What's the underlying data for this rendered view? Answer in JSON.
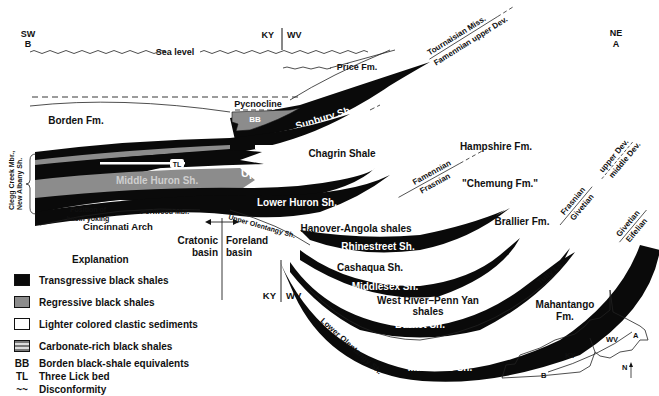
{
  "orientation": {
    "left_dir": "SW",
    "left_point": "B",
    "right_dir": "NE",
    "right_point": "A"
  },
  "state_border_labels": {
    "left": "KY",
    "right": "WV"
  },
  "sea_level": "Sea level",
  "pycnocline": "Pycnocline",
  "units": {
    "price": "Price Fm.",
    "borden": "Borden Fm.",
    "bb": "BB",
    "sunbury": "Sunbury Sh.",
    "berea": "Berea-Bedford",
    "cleveland": "Cleveland Sh.",
    "tl": "TL",
    "upper_huron": "Upper Huron Sh.",
    "middle_huron": "Middle Huron Sh.",
    "chagrin": "Chagrin Shale",
    "hampshire": "Hampshire Fm.",
    "chemung": "\"Chemung Fm.\"",
    "brallier": "Brallier Fm.",
    "lower_huron": "Lower Huron Sh.",
    "hanover": "Hanover-Angola shales",
    "rhinestreet": "Rhinestreet Sh.",
    "cashaqua": "Cashaqua Sh.",
    "middlesex": "Middlesex Sh.",
    "west_river_1": "West River–Penn Yan",
    "west_river_2": "shales",
    "burket": "Burket Sh.",
    "marcellus": "Marcellus Sh.",
    "mahantango_1": "Mahantango",
    "mahantango_2": "Fm.",
    "tully": "Tully Ls.",
    "upper_olentangy": "Upper Olentangy Sh.",
    "lower_olentangy": "Lower Olentangy Sh.",
    "clegg_1": "Clegg Creek Mbr.,",
    "clegg_2": "New Albany Sh.",
    "basin_yoking_1": "Position of",
    "basin_yoking_2": "basin yoking",
    "portwood": "Portwood Mbr.",
    "cincinnati": "Cincinnati Arch",
    "cratonic_1": "Cratonic",
    "cratonic_2": "basin",
    "foreland_1": "Foreland",
    "foreland_2": "basin"
  },
  "time_boundaries": {
    "tournaisian": "Tournaisian Miss.",
    "famennian_upper": "Famennian upper Dev.",
    "famennian": "Famennian",
    "frasnian": "Frasnian",
    "frasnian2": "Frasnian",
    "givetian": "Givetian",
    "upper_dev": "upper Dev.",
    "middle_dev": "middle Dev.",
    "givetian2": "Givetian",
    "eifelian": "Eifelian"
  },
  "legend": {
    "title": "Explanation",
    "items": [
      {
        "swatch": "black",
        "label": "Transgressive black shales"
      },
      {
        "swatch": "gray",
        "label": "Regressive black shales"
      },
      {
        "swatch": "white",
        "label": "Lighter colored clastic sediments"
      },
      {
        "swatch": "brick",
        "label": "Carbonate-rich black shales"
      }
    ],
    "abbreviations": [
      {
        "abbr": "BB",
        "label": "Borden black-shale equivalents"
      },
      {
        "abbr": "TL",
        "label": "Three Lick bed"
      },
      {
        "abbr": "~~",
        "label": "Disconformity"
      }
    ]
  },
  "inset_map": {
    "ky": "KY",
    "wv": "WV",
    "a": "A",
    "b": "B",
    "north": "N"
  },
  "colors": {
    "black_shale": "#0a0a0a",
    "regressive": "#8c8c8c",
    "background": "#ffffff"
  }
}
